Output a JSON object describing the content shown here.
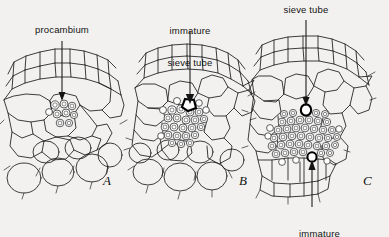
{
  "figure": {
    "background_color": "#f2f1ef",
    "ink_color": "#141414",
    "width": 389,
    "height": 237
  },
  "annotations": [
    {
      "id": "procambium",
      "text": "procambium",
      "lines": [
        "procambium"
      ],
      "panel": "A",
      "position": "above",
      "label_x": 62,
      "label_y": 29,
      "leader": {
        "x1": 62,
        "y1": 41,
        "x2": 62,
        "y2": 97,
        "arrow": "down"
      }
    },
    {
      "id": "immature-sieve-tube",
      "text": "immature sieve tube",
      "lines": [
        "immature",
        "sieve tube"
      ],
      "panel": "B",
      "position": "above",
      "label_x": 190,
      "label_y": 8,
      "leader": {
        "x1": 190,
        "y1": 31,
        "x2": 190,
        "y2": 105,
        "arrow": "down"
      }
    },
    {
      "id": "sieve-tube",
      "text": "sieve tube",
      "lines": [
        "sieve tube"
      ],
      "panel": "C",
      "position": "above",
      "label_x": 306,
      "label_y": 8,
      "leader": {
        "x1": 306,
        "y1": 20,
        "x2": 306,
        "y2": 106,
        "arrow": "down"
      }
    },
    {
      "id": "immature-xylem-element",
      "text": "immature xylem element",
      "lines": [
        "immature",
        "xylem element"
      ],
      "panel": "C",
      "position": "below",
      "label_x": 319,
      "label_y": 211,
      "leader": {
        "x1": 312,
        "y1": 207,
        "x2": 312,
        "y2": 160,
        "arrow": "up"
      }
    }
  ],
  "panels": [
    {
      "id": "A",
      "letter": "A",
      "letter_x": 103,
      "letter_y": 174,
      "stage_description": "procambium strand only",
      "procambium_cell_count": 9,
      "marked_cells": []
    },
    {
      "id": "B",
      "letter": "B",
      "letter_x": 239,
      "letter_y": 174,
      "stage_description": "first immature sieve tube differentiated",
      "procambium_cell_count": 26,
      "marked_cells": [
        "immature sieve tube"
      ]
    },
    {
      "id": "C",
      "letter": "C",
      "letter_x": 363,
      "letter_y": 174,
      "stage_description": "mature sieve tube and immature xylem element",
      "procambium_cell_count": 58,
      "marked_cells": [
        "sieve tube",
        "immature xylem element"
      ]
    }
  ]
}
